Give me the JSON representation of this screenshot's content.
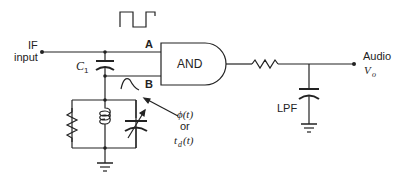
{
  "diagram": {
    "type": "circuit-schematic",
    "labels": {
      "if_input_line1": "IF",
      "if_input_line2": "input",
      "capacitor_c1": "C",
      "capacitor_c1_sub": "1",
      "gate": "AND",
      "input_a": "A",
      "input_b": "B",
      "output_line1": "Audio",
      "output_v": "V",
      "output_v_sub": "o",
      "lpf": "LPF",
      "phase_line1": "ϕ(t)",
      "phase_or": "or",
      "phase_line3": "t",
      "phase_line3_sub": "d",
      "phase_line3_tail": "(t)"
    },
    "components": [
      {
        "id": "C1",
        "kind": "capacitor",
        "role": "coupling/quadrature capacitor"
      },
      {
        "id": "R_tank",
        "kind": "resistor",
        "role": "tank damping"
      },
      {
        "id": "L_tank",
        "kind": "inductor",
        "role": "tank inductor"
      },
      {
        "id": "C_tank",
        "kind": "variable-capacitor",
        "role": "tank tuning"
      },
      {
        "id": "U1",
        "kind": "AND-gate"
      },
      {
        "id": "R_lpf",
        "kind": "resistor",
        "role": "low-pass filter"
      },
      {
        "id": "C_lpf",
        "kind": "capacitor",
        "role": "low-pass filter"
      }
    ],
    "waveforms": {
      "input_a": "square-wave",
      "input_b": "sine-half-cycle"
    },
    "colors": {
      "stroke": "#222222",
      "background": "#ffffff"
    }
  }
}
